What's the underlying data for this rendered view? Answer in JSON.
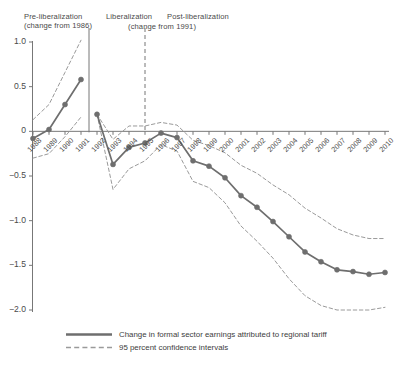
{
  "periods": [
    {
      "name": "pre",
      "line1": "Pre-liberalization",
      "line2": "(change from 1986)"
    },
    {
      "name": "lib",
      "line1": "Liberalization",
      "line2": ""
    },
    {
      "name": "post",
      "line1": "Post-liberalization",
      "line2": "(change from 1991)"
    }
  ],
  "legend": {
    "series_label": "Change in formal sector earnings attributed to regional tariff",
    "ci_label": "95 percent confidence intervals"
  },
  "colors": {
    "series": "#6e6e6e",
    "ci": "#9a9a9a",
    "axis": "#777777",
    "text": "#4a4a4a",
    "background": "#ffffff"
  },
  "chart_data": {
    "type": "line",
    "title": "",
    "xlabel": "",
    "ylabel": "",
    "ylim": [
      -2.0,
      1.0
    ],
    "yticks": [
      1.0,
      0.5,
      0,
      -0.5,
      -1.0,
      -1.5,
      -2.0
    ],
    "ytick_labels": [
      "1.0",
      "0.5",
      "0",
      "−0.5",
      "−1.0",
      "−1.5",
      "−2.0"
    ],
    "grid": false,
    "legend_position": "bottom",
    "x": [
      1988,
      1989,
      1990,
      1991,
      1992,
      1993,
      1994,
      1995,
      1996,
      1997,
      1998,
      1999,
      2000,
      2001,
      2002,
      2003,
      2004,
      2005,
      2006,
      2007,
      2008,
      2009,
      2010
    ],
    "xtick_labels": [
      "1988",
      "1989",
      "1990",
      "1991",
      "1992",
      "1993",
      "1994",
      "1995",
      "1996",
      "1997",
      "1998",
      "1999",
      "2000",
      "2001",
      "2002",
      "2003",
      "2004",
      "2005",
      "2006",
      "2007",
      "2008",
      "2009",
      "2010"
    ],
    "vertical_dividers": [
      {
        "x": 1991.5,
        "style": "solid"
      },
      {
        "x": 1995.0,
        "style": "dashed"
      }
    ],
    "segments": [
      {
        "name": "pre-liberalization",
        "x": [
          1988,
          1989,
          1990,
          1991
        ],
        "values": [
          -0.08,
          0.02,
          0.3,
          0.58
        ],
        "ci_upper": [
          0.13,
          0.3,
          0.66,
          1.02
        ],
        "ci_lower": [
          -0.3,
          -0.25,
          -0.06,
          0.16
        ]
      },
      {
        "name": "post-liberalization",
        "x": [
          1992,
          1993,
          1994,
          1995,
          1996,
          1997,
          1998,
          1999,
          2000,
          2001,
          2002,
          2003,
          2004,
          2005,
          2006,
          2007,
          2008,
          2009,
          2010
        ],
        "values": [
          0.19,
          -0.37,
          -0.18,
          -0.13,
          -0.02,
          -0.07,
          -0.33,
          -0.39,
          -0.52,
          -0.72,
          -0.85,
          -1.01,
          -1.18,
          -1.35,
          -1.46,
          -1.55,
          -1.57,
          -1.6,
          -1.58
        ],
        "ci_upper": [
          0.19,
          -0.09,
          0.06,
          0.06,
          0.1,
          0.07,
          -0.1,
          -0.16,
          -0.24,
          -0.38,
          -0.47,
          -0.6,
          -0.71,
          -0.86,
          -0.97,
          -1.09,
          -1.16,
          -1.2,
          -1.2
        ],
        "ci_lower": [
          0.19,
          -0.65,
          -0.42,
          -0.33,
          -0.15,
          -0.22,
          -0.56,
          -0.63,
          -0.8,
          -1.06,
          -1.23,
          -1.42,
          -1.65,
          -1.84,
          -1.95,
          -2.0,
          -2.0,
          -2.0,
          -1.97
        ]
      }
    ],
    "series": [
      {
        "name": "Change in formal sector earnings attributed to regional tariff",
        "values": [
          -0.08,
          0.02,
          0.3,
          0.58,
          0.19,
          -0.37,
          -0.18,
          -0.13,
          -0.02,
          -0.07,
          -0.33,
          -0.39,
          -0.52,
          -0.72,
          -0.85,
          -1.01,
          -1.18,
          -1.35,
          -1.46,
          -1.55,
          -1.57,
          -1.6,
          -1.58
        ]
      }
    ]
  }
}
